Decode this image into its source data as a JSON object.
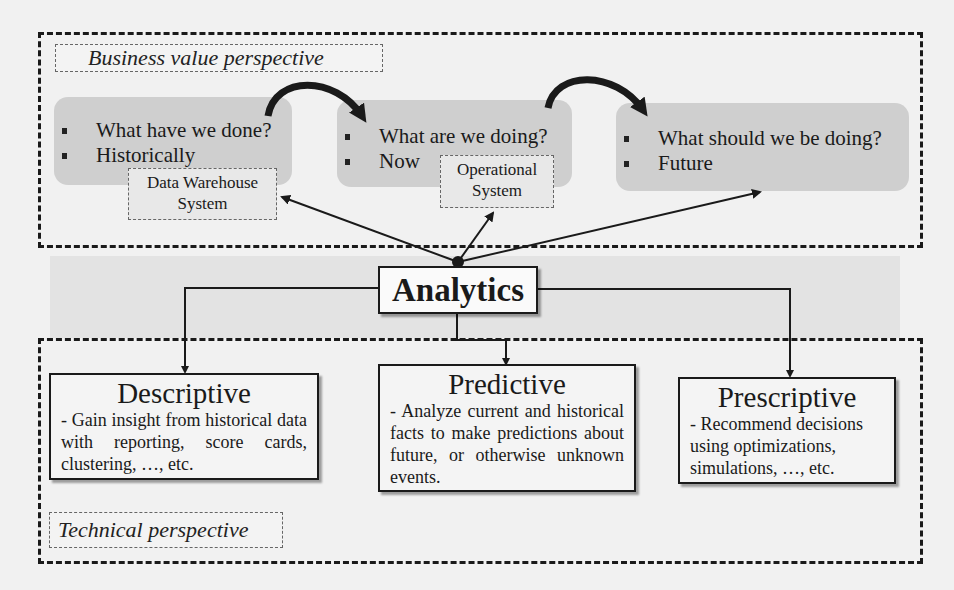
{
  "business": {
    "label": "Business value perspective",
    "stages": [
      {
        "bullets": [
          "What have we done?",
          "Historically"
        ],
        "system": [
          "Data Warehouse",
          "System"
        ]
      },
      {
        "bullets": [
          "What are we doing?",
          "Now"
        ],
        "system": [
          "Operational",
          "System"
        ]
      },
      {
        "bullets": [
          "What should we be doing?",
          "Future"
        ]
      }
    ]
  },
  "center": {
    "label": "Analytics"
  },
  "technical": {
    "label": "Technical perspective",
    "types": [
      {
        "title": "Descriptive",
        "desc": "- Gain insight from historical data with reporting, score cards, clustering, …, etc."
      },
      {
        "title": "Predictive",
        "desc": "- Analyze current and historical facts to make predictions about future, or otherwise unknown events."
      },
      {
        "title": "Prescriptive",
        "desc": "- Recommend decisions using optimizations, simulations, …, etc."
      }
    ]
  }
}
